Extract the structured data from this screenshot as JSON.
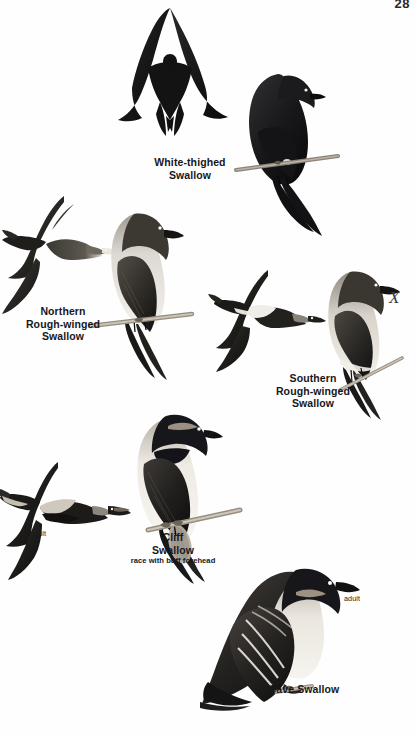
{
  "page": {
    "number": "28",
    "kind": "field-guide-plate",
    "background_color": "#ffffff",
    "ink_color": "#17171a"
  },
  "species": [
    {
      "id": "white-thighed-swallow",
      "common_name_line1": "White-thighed",
      "common_name_line2": "Swallow",
      "caption": "White-thighed Swallow",
      "figures": [
        "flight",
        "perched"
      ],
      "plumage_notes": [
        "blackish overall",
        "white thigh patch"
      ],
      "age_labels": []
    },
    {
      "id": "northern-rough-winged-swallow",
      "common_name_line1": "Northern",
      "common_name_line2": "Rough-winged",
      "common_name_line3": "Swallow",
      "caption": "Northern Rough-winged Swallow",
      "figures": [
        "flight",
        "perched"
      ],
      "plumage_notes": [
        "brown above",
        "dusky throat",
        "pale belly"
      ],
      "age_labels": []
    },
    {
      "id": "southern-rough-winged-swallow",
      "common_name_line1": "Southern",
      "common_name_line2": "Rough-winged",
      "common_name_line3": "Swallow",
      "caption": "Southern Rough-winged Swallow",
      "figures": [
        "flight",
        "perched"
      ],
      "plumage_notes": [
        "pale rump band",
        "cinnamon throat"
      ],
      "age_labels": []
    },
    {
      "id": "cliff-swallow",
      "common_name_line1": "Cliff",
      "common_name_line2": "Swallow",
      "subtitle": "race with buff forehead",
      "caption": "Cliff Swallow",
      "figures": [
        "flight",
        "perched"
      ],
      "plumage_notes": [
        "buff forehead",
        "pale rump",
        "square tail"
      ],
      "age_labels": [
        "adult",
        "adult"
      ]
    },
    {
      "id": "cave-swallow",
      "common_name_line1": "Cave Swallow",
      "caption": "Cave Swallow",
      "figures": [
        "perched"
      ],
      "plumage_notes": [
        "cinnamon throat",
        "dark cap"
      ],
      "age_labels": [
        "adult"
      ]
    }
  ],
  "labels": {
    "white_thighed": {
      "line1": "White-thighed",
      "line2": "Swallow"
    },
    "northern_rw": {
      "line1": "Northern",
      "line2": "Rough-winged",
      "line3": "Swallow"
    },
    "southern_rw": {
      "line1": "Southern",
      "line2": "Rough-winged",
      "line3": "Swallow"
    },
    "cliff": {
      "line1": "Cliff",
      "line2": "Swallow",
      "sub": "race with buff forehead"
    },
    "cave": {
      "line1": "Cave Swallow"
    },
    "adult_cliff_perched": "adult",
    "adult_cliff_flight": "adult",
    "adult_cave": "adult"
  },
  "annotations": {
    "hand_mark": "X"
  }
}
